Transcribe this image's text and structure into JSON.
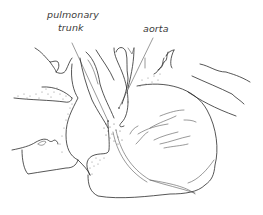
{
  "diagram": {
    "labels": [
      {
        "id": "pulmonary-trunk",
        "line1": "pulmonary",
        "line2": "trunk"
      },
      {
        "id": "aorta",
        "line1": "aorta"
      }
    ],
    "colors": {
      "ink": "#2b2b2b",
      "label": "#3a3a3a",
      "background": "#ffffff"
    }
  }
}
